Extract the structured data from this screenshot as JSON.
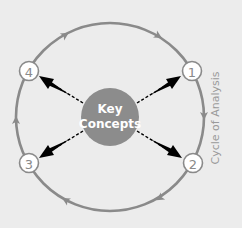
{
  "diagram": {
    "title": "Cycle of Analysis",
    "center": {
      "line1": "Key",
      "line2": "Concepts"
    },
    "nodes": [
      {
        "id": "1",
        "label": "1"
      },
      {
        "id": "2",
        "label": "2"
      },
      {
        "id": "3",
        "label": "3"
      },
      {
        "id": "4",
        "label": "4"
      }
    ],
    "cycle_direction": "clockwise",
    "cycle_order": [
      "1",
      "2",
      "3",
      "4"
    ],
    "colors": {
      "background": "#ececec",
      "ring": "#8a8a8a",
      "center_fill": "#8c8c8c",
      "center_text": "#ffffff",
      "node_fill": "#ffffff",
      "node_stroke": "#8a8a8a",
      "spoke_arrow": "#000000",
      "cycle_label": "#9a9a9a"
    }
  }
}
